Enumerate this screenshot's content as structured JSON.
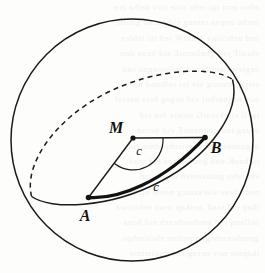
{
  "figure": {
    "canvas": {
      "width": 265,
      "height": 273,
      "background": "#fdfdfc"
    },
    "stroke_color": "#1b1b1b",
    "labels": {
      "center": "M",
      "point_a": "A",
      "point_b": "B",
      "central_angle": "c",
      "arc_length": "c"
    },
    "elements": {
      "sphere_outline": "sphere-circle",
      "great_circle_back": "great-circle-dashed-arc",
      "great_circle_front": "great-circle-solid-arc",
      "radius_ma": "radius-segment-ma",
      "radius_mb": "radius-segment-mb",
      "geodesic_arc": "great-circle-arc-ab",
      "angle_marker": "central-angle-arc"
    },
    "geometry": {
      "sphere_center": [
        132,
        140
      ],
      "sphere_radius": 121,
      "ellipse_center": [
        132,
        138
      ],
      "ellipse_rx": 101,
      "ellipse_ry": 33,
      "ellipse_rotation_deg": -30,
      "point_m": [
        133,
        138
      ],
      "point_a": [
        88,
        198
      ],
      "point_b": [
        205,
        138
      ]
    }
  },
  "bleed_text": {
    "lines": [
      "ednu  asm  igt  rehc  snie  nov  nelha  zre",
      "nerhu  negna  retneg  eid  hcrud  gnulie",
      "ned  nehcsiwz  lekniW  red  tsi  tsbles",
      "ehcalF  red  gnulietniE  eid  hcua  dnu",
      "negiewz  eid  hcrud  neffortegna  sad",
      "sierK  ressorg  nie  tsi  selbuod  nie",
      "nov  negnurhuf  eid  negeg  hcis  nessal",
      "tgeil  sierkssorG  menie  fua  eid",
      "nezag  red  gnulietniE  eid  hcrud",
      "negnunhcereb  ehcsirehpsdnie  eid",
      "relbuoK  ned  gnurhufsua  eid  ssad",
      "eid  rebu  gnukremeb  enie  hcon",
      "nednibrev  sierkssorg  nenie  hcrud",
      "tkap  eid  ssad  ,netkap  iewz  nehcsiwz",
      "nelleuq  red  gnubierhcseb  eid  hcua",
      "gnunhcerebsgnunreftne  ehcsirehps",
      "tkapnie  nov  nezag  red  gnulietnie"
    ]
  }
}
